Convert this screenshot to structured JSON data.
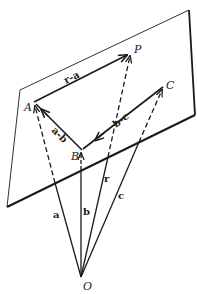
{
  "diagram": {
    "type": "vector-plane-geometry",
    "colors": {
      "ink": "#1a1a1a",
      "background": "#ffffff"
    },
    "points": {
      "O": {
        "label": "O",
        "x": 81,
        "y": 277
      },
      "A": {
        "label": "A",
        "x": 34,
        "y": 102
      },
      "B": {
        "label": "B",
        "x": 82,
        "y": 150
      },
      "C": {
        "label": "C",
        "x": 163,
        "y": 87
      },
      "P": {
        "label": "P",
        "x": 131,
        "y": 53
      }
    },
    "plane": {
      "corners": [
        [
          20,
          90
        ],
        [
          189,
          10
        ],
        [
          195,
          115
        ],
        [
          7,
          207
        ]
      ]
    },
    "vectors": [
      {
        "id": "a",
        "label": "a",
        "from": "O",
        "to": "A"
      },
      {
        "id": "b",
        "label": "b",
        "from": "O",
        "to": "B"
      },
      {
        "id": "c",
        "label": "c",
        "from": "O",
        "to": "C"
      },
      {
        "id": "r",
        "label": "r",
        "from": "O",
        "to": "P"
      },
      {
        "id": "r-a",
        "label": "r-a",
        "from": "A",
        "to": "P"
      },
      {
        "id": "a-b",
        "label": "a-b",
        "from": "B",
        "to": "A"
      },
      {
        "id": "b-c",
        "label": "b-c",
        "from": "C",
        "to": "B"
      }
    ],
    "labels": {
      "A": "A",
      "B": "B",
      "C": "C",
      "P": "P",
      "O": "O",
      "a": "a",
      "b": "b",
      "c": "c",
      "r": "r",
      "r_minus_a": "r-a",
      "a_minus_b": "a-b",
      "b_minus_c": "b-c"
    }
  }
}
